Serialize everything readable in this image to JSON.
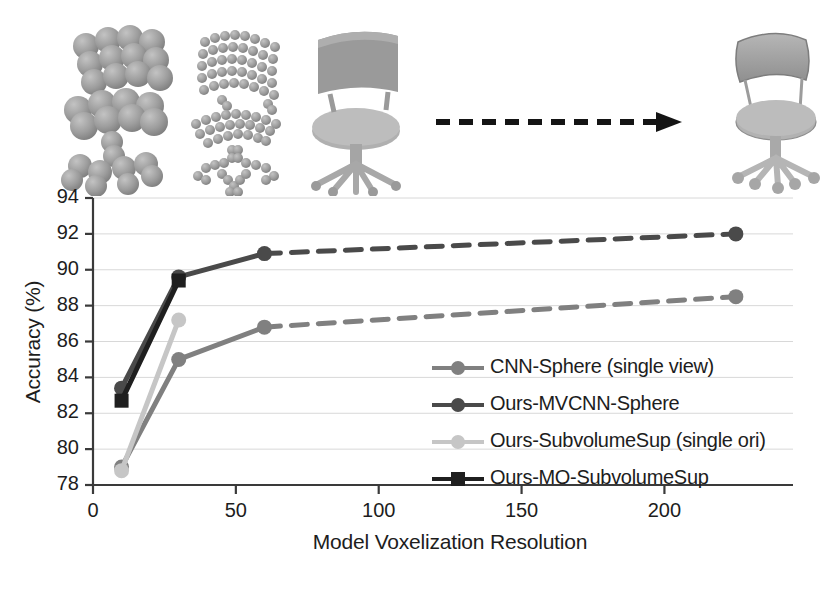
{
  "figure": {
    "illustration": {
      "caption_alt": "voxelized chair models at increasing resolution with arrow to original mesh chair",
      "arrow_name": "dashed-right-arrow",
      "items": [
        {
          "name": "voxel-chair-coarse",
          "label": "low resolution voxelization"
        },
        {
          "name": "voxel-chair-medium",
          "label": "medium resolution voxelization"
        },
        {
          "name": "voxel-chair-fine",
          "label": "high resolution voxelization"
        },
        {
          "name": "mesh-chair-original",
          "label": "original mesh chair"
        }
      ]
    }
  },
  "chart_data": {
    "type": "line",
    "title": "",
    "xlabel": "Model Voxelization Resolution",
    "ylabel": "Accuracy (%)",
    "xlim": [
      0,
      245
    ],
    "ylim": [
      78,
      94
    ],
    "xticks": [
      0,
      50,
      100,
      150,
      200
    ],
    "xticklabels": [
      "0",
      "50",
      "100",
      "150",
      "200"
    ],
    "yticks": [
      78,
      80,
      82,
      84,
      86,
      88,
      90,
      92,
      94
    ],
    "yticklabels": [
      "78",
      "80",
      "82",
      "84",
      "86",
      "88",
      "90",
      "92",
      "94"
    ],
    "grid": "horizontal",
    "legend_position": "inside-lower-right",
    "series": [
      {
        "name": "CNN-Sphere (single view)",
        "color": "#808080",
        "marker": "circle",
        "x": [
          10,
          30,
          60,
          225
        ],
        "y": [
          79.0,
          85.0,
          86.8,
          88.5
        ],
        "dashed_from_index": 2
      },
      {
        "name": "Ours-MVCNN-Sphere",
        "color": "#4a4a4a",
        "marker": "circle",
        "x": [
          10,
          30,
          60,
          225
        ],
        "y": [
          83.4,
          89.6,
          90.9,
          92.0
        ],
        "dashed_from_index": 2
      },
      {
        "name": "Ours-SubvolumeSup (single ori)",
        "color": "#c6c6c6",
        "marker": "circle",
        "x": [
          10,
          30
        ],
        "y": [
          78.8,
          87.2
        ],
        "dashed_from_index": -1
      },
      {
        "name": "Ours-MO-SubvolumeSup",
        "color": "#1f1f1f",
        "marker": "square",
        "x": [
          10,
          30
        ],
        "y": [
          82.7,
          89.4
        ],
        "dashed_from_index": -1
      }
    ]
  }
}
